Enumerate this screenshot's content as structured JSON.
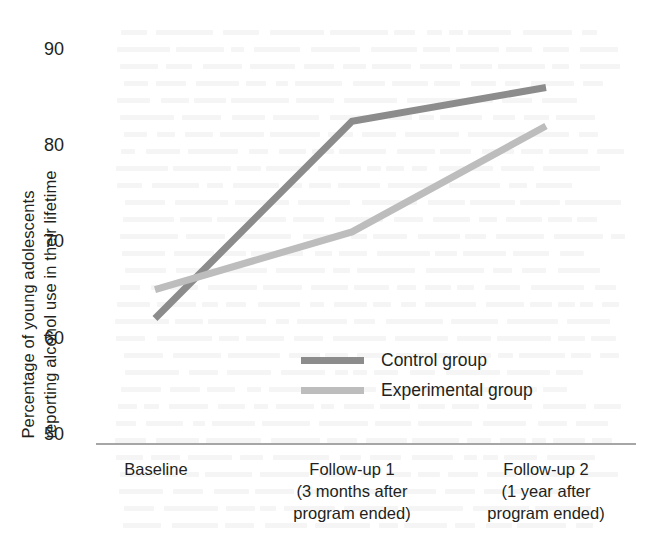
{
  "chart_data": {
    "type": "line",
    "title": "",
    "subtitle": "",
    "xlabel": "",
    "ylabel": "Percentage of young adolescents reporting alcohol use in their lifetime",
    "ylabel_line1": "Percentage of young adolescents",
    "ylabel_line2": "reporting alcohol use in their lifetime",
    "categories": [
      "Baseline",
      "Follow-up 1",
      "Follow-up 2"
    ],
    "category_sublabels": [
      [
        "Baseline"
      ],
      [
        "Follow-up 1",
        "(3 months after",
        "program ended)"
      ],
      [
        "Follow-up 2",
        "(1 year after",
        "program ended)"
      ]
    ],
    "ylim": [
      50,
      90
    ],
    "yticks": [
      90,
      80,
      70,
      60,
      50
    ],
    "ytick_labels": [
      "90",
      "80",
      "70",
      "60",
      "50"
    ],
    "grid": false,
    "legend_position": "center",
    "series": [
      {
        "name": "Control group",
        "values": [
          62,
          82.5,
          86
        ],
        "color": "#8c8c8c"
      },
      {
        "name": "Experimental group",
        "values": [
          65,
          71,
          82
        ],
        "color": "#bdbdbd"
      }
    ],
    "axis_color": "#a6a6a6",
    "text_color": "#231f20"
  },
  "legend": {
    "items": [
      {
        "label": "Control group",
        "color": "#8c8c8c"
      },
      {
        "label": "Experimental group",
        "color": "#bdbdbd"
      }
    ]
  },
  "yaxis": {
    "title_line1": "Percentage of young adolescents",
    "title_line2": "reporting alcohol use in their lifetime",
    "ticks": [
      "90",
      "80",
      "70",
      "60",
      "50"
    ]
  },
  "xaxis": {
    "groups": [
      {
        "l1": "Baseline",
        "l2": "",
        "l3": ""
      },
      {
        "l1": "Follow-up 1",
        "l2": "(3 months after",
        "l3": "program ended)"
      },
      {
        "l1": "Follow-up 2",
        "l2": "(1 year after",
        "l3": "program ended)"
      }
    ]
  }
}
